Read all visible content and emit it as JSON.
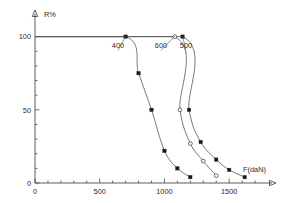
{
  "chart_data": {
    "type": "line",
    "title": "",
    "xlabel": "F(daN)",
    "ylabel": "R%",
    "xlim": [
      0,
      1800
    ],
    "ylim": [
      0,
      110
    ],
    "grid": false,
    "legend_position": "inline-curve-labels",
    "x_ticks": [
      0,
      500,
      1000,
      1500
    ],
    "x_tick_labels": [
      "0",
      "500",
      "1000",
      "1500"
    ],
    "x_minor_tick_step": 100,
    "y_ticks": [
      0,
      50,
      100
    ],
    "y_tick_labels": [
      "0",
      "50",
      "100"
    ],
    "y_minor_tick_step": 10,
    "series": [
      {
        "name": "400",
        "label": "400",
        "marker": "filled-square",
        "points": [
          {
            "x": 0,
            "y": 100
          },
          {
            "x": 700,
            "y": 100
          },
          {
            "x": 800,
            "y": 75
          },
          {
            "x": 900,
            "y": 50
          },
          {
            "x": 1000,
            "y": 22
          },
          {
            "x": 1100,
            "y": 10
          },
          {
            "x": 1200,
            "y": 4
          }
        ]
      },
      {
        "name": "600",
        "label": "600",
        "marker": "open-circle",
        "points": [
          {
            "x": 0,
            "y": 100
          },
          {
            "x": 1080,
            "y": 100
          },
          {
            "x": 1120,
            "y": 50
          },
          {
            "x": 1200,
            "y": 27
          },
          {
            "x": 1300,
            "y": 15
          },
          {
            "x": 1400,
            "y": 5
          }
        ]
      },
      {
        "name": "500",
        "label": "500",
        "marker": "filled-square",
        "points": [
          {
            "x": 0,
            "y": 100
          },
          {
            "x": 1140,
            "y": 100
          },
          {
            "x": 1190,
            "y": 50
          },
          {
            "x": 1280,
            "y": 28
          },
          {
            "x": 1400,
            "y": 16
          },
          {
            "x": 1500,
            "y": 9
          },
          {
            "x": 1620,
            "y": 4
          }
        ]
      }
    ],
    "curve_labels": [
      {
        "text": "400",
        "x": 700,
        "label_x": 118,
        "label_y": 48
      },
      {
        "text": "600",
        "x": 1080,
        "label_x": 161,
        "label_y": 48
      },
      {
        "text": "500",
        "x": 1140,
        "label_x": 186,
        "label_y": 48
      }
    ]
  }
}
